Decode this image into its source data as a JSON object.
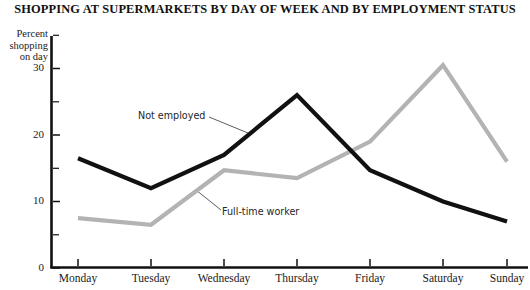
{
  "chart_data": {
    "type": "line",
    "title": "SHOPPING AT SUPERMARKETS BY DAY OF WEEK AND BY EMPLOYMENT STATUS",
    "xlabel": "",
    "ylabel": "Percent shopping on day",
    "ylabel_lines": [
      "Percent",
      "shopping",
      "on day"
    ],
    "categories": [
      "Monday",
      "Tuesday",
      "Wednesday",
      "Thursday",
      "Friday",
      "Saturday",
      "Sunday"
    ],
    "ylim": [
      0,
      35
    ],
    "yticks": [
      0,
      10,
      20,
      30
    ],
    "ytick_labels": [
      "0",
      "10",
      "20",
      "30"
    ],
    "yminor_ticks": [
      5,
      15,
      25,
      35
    ],
    "grid": false,
    "legend_position": "inline-annotations",
    "series": [
      {
        "name": "Not employed",
        "color": "#111111",
        "values": [
          16.5,
          12.0,
          17.0,
          26.0,
          14.7,
          10.0,
          7.0
        ]
      },
      {
        "name": "Full-time worker",
        "color": "#b3b3b3",
        "values": [
          7.5,
          6.5,
          14.7,
          13.5,
          19.0,
          30.5,
          16.0
        ]
      }
    ],
    "annotations": [
      {
        "text": "Not employed",
        "series": "Not employed"
      },
      {
        "text": "Full-time worker",
        "series": "Full-time worker"
      }
    ]
  },
  "colors": {
    "not_employed": "#111111",
    "full_time_worker": "#b3b3b3",
    "axis": "#111111",
    "background": "#ffffff"
  }
}
